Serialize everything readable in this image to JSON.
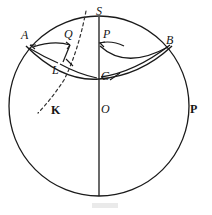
{
  "figure": {
    "kind": "geometry-diagram",
    "stroke_color": "#1a1a1a",
    "background_color": "#ffffff",
    "dashed_color": "#555555"
  },
  "circle": {
    "name": "main-circle",
    "cx": 99,
    "cy": 106,
    "r": 90
  },
  "axis": {
    "name": "vertical-axis",
    "x": 99,
    "y_top": 17,
    "y_bottom": 196
  },
  "labels": [
    {
      "id": "S",
      "text": "S",
      "style": "italic",
      "x": 96,
      "y": 5,
      "name": "label-point-s"
    },
    {
      "id": "A",
      "text": "A",
      "style": "italic",
      "x": 21,
      "y": 29,
      "name": "label-point-a"
    },
    {
      "id": "Q",
      "text": "Q",
      "style": "italic",
      "x": 64,
      "y": 28,
      "name": "label-point-q"
    },
    {
      "id": "P",
      "text": "P",
      "style": "italic",
      "x": 103,
      "y": 28,
      "name": "label-point-p-upper"
    },
    {
      "id": "B",
      "text": "B",
      "style": "italic",
      "x": 166,
      "y": 34,
      "name": "label-point-b"
    },
    {
      "id": "L",
      "text": "L",
      "style": "italic",
      "x": 52,
      "y": 64,
      "name": "label-point-l"
    },
    {
      "id": "C",
      "text": "C",
      "style": "italic",
      "x": 101,
      "y": 70,
      "name": "label-point-c"
    },
    {
      "id": "K",
      "text": "K",
      "style": "bold",
      "x": 51,
      "y": 104,
      "name": "label-point-k"
    },
    {
      "id": "O",
      "text": "O",
      "style": "italic",
      "x": 101,
      "y": 103,
      "name": "label-point-o"
    },
    {
      "id": "P2",
      "text": "P",
      "style": "bold",
      "x": 190,
      "y": 103,
      "name": "label-point-p-right"
    }
  ],
  "arcs": {
    "horizon_arc": {
      "name": "arc-a-c-b",
      "from": "A",
      "to": "B",
      "through": "C"
    },
    "angle_arc_a": {
      "name": "angle-arc-at-a",
      "vertex": "A",
      "toward": "Q"
    },
    "angle_arc_c_left": {
      "name": "angle-arc-c-to-l",
      "vertex": "C",
      "toward": "L"
    },
    "angle_arc_c_right": {
      "name": "angle-arc-c-to-b",
      "vertex": "C",
      "toward": "B"
    },
    "angle_arc_p": {
      "name": "angle-arc-at-p",
      "vertex": "P",
      "toward": "C"
    }
  },
  "dashed_curve": {
    "name": "dashed-great-circle",
    "from": "S",
    "through": "L",
    "to": "K",
    "style": "dashed"
  },
  "tick_marks": [
    {
      "name": "tick-near-l",
      "x": 70,
      "y": 63
    },
    {
      "name": "tick-near-c",
      "x": 116,
      "y": 75
    }
  ]
}
